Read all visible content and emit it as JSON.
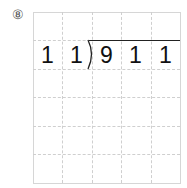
{
  "problem": {
    "label": "⑧",
    "divisor": [
      "1",
      "1"
    ],
    "dividend": [
      "9",
      "1",
      "1"
    ]
  },
  "grid": {
    "columns": 5,
    "rows": 6,
    "line_color": "#cfcfcf"
  }
}
